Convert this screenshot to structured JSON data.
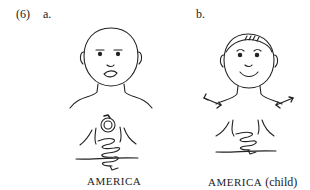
{
  "example": {
    "number": "(6)",
    "panels": [
      {
        "label": "a.",
        "caption": "AMERICA",
        "figure": "bald-face-with-closed-mouth; hands interlocked at chest with circular motion icon"
      },
      {
        "label": "b.",
        "caption_sign": "AMERICA",
        "caption_note": "(child)",
        "figure": "face-with-hair-smiling; hands interlocked at chest; double-headed arrows at shoulders"
      }
    ]
  }
}
